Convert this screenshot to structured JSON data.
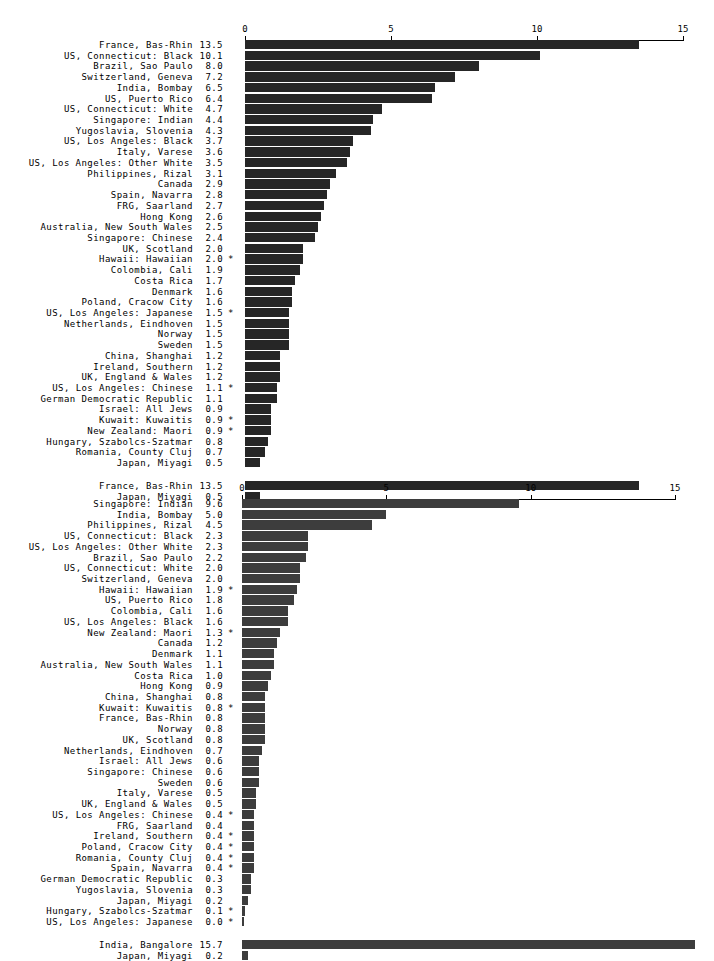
{
  "figure": {
    "background": "#ffffff",
    "bar_color_top": "#262626",
    "bar_color_bottom": "#3d3d3d"
  },
  "chart_data": [
    {
      "type": "bar",
      "orientation": "horizontal",
      "title": "",
      "xlabel": "",
      "ylabel": "",
      "xlim": [
        0,
        15
      ],
      "xticks": [
        0,
        5,
        10,
        15
      ],
      "xtick_labels": [
        "0",
        "5",
        "10",
        "15"
      ],
      "grid": false,
      "legend": "none",
      "bar_color": "#262626",
      "footnote_marker": "*",
      "categories": [
        "France, Bas-Rhin",
        "US, Connecticut: Black",
        "Brazil, Sao Paulo",
        "Switzerland, Geneva",
        "India, Bombay",
        "US, Puerto Rico",
        "US, Connecticut: White",
        "Singapore: Indian",
        "Yugoslavia, Slovenia",
        "US, Los Angeles: Black",
        "Italy, Varese",
        "US, Los Angeles: Other White",
        "Philippines, Rizal",
        "Canada",
        "Spain, Navarra",
        "FRG, Saarland",
        "Hong Kong",
        "Australia, New South Wales",
        "Singapore: Chinese",
        "UK, Scotland",
        "Hawaii: Hawaiian",
        "Colombia, Cali",
        "Costa Rica",
        "Denmark",
        "Poland, Cracow City",
        "US, Los Angeles: Japanese",
        "Netherlands, Eindhoven",
        "Norway",
        "Sweden",
        "China, Shanghai",
        "Ireland, Southern",
        "UK, England & Wales",
        "US, Los Angeles: Chinese",
        "German Democratic Republic",
        "Israel: All Jews",
        "Kuwait: Kuwaitis",
        "New Zealand: Maori",
        "Hungary, Szabolcs-Szatmar",
        "Romania, County Cluj",
        "Japan, Miyagi"
      ],
      "values": [
        13.5,
        10.1,
        8.0,
        7.2,
        6.5,
        6.4,
        4.7,
        4.4,
        4.3,
        3.7,
        3.6,
        3.5,
        3.1,
        2.9,
        2.8,
        2.7,
        2.6,
        2.5,
        2.4,
        2.0,
        2.0,
        1.9,
        1.7,
        1.6,
        1.6,
        1.5,
        1.5,
        1.5,
        1.5,
        1.2,
        1.2,
        1.2,
        1.1,
        1.1,
        0.9,
        0.9,
        0.9,
        0.8,
        0.7,
        0.5
      ],
      "value_labels": [
        "13.5",
        "10.1",
        "8.0",
        "7.2",
        "6.5",
        "6.4",
        "4.7",
        "4.4",
        "4.3",
        "3.7",
        "3.6",
        "3.5",
        "3.1",
        "2.9",
        "2.8",
        "2.7",
        "2.6",
        "2.5",
        "2.4",
        "2.0",
        "2.0",
        "1.9",
        "1.7",
        "1.6",
        "1.6",
        "1.5",
        "1.5",
        "1.5",
        "1.5",
        "1.2",
        "1.2",
        "1.2",
        "1.1",
        "1.1",
        "0.9",
        "0.9",
        "0.9",
        "0.8",
        "0.7",
        "0.5"
      ],
      "markers": [
        "",
        "",
        "",
        "",
        "",
        "",
        "",
        "",
        "",
        "",
        "",
        "",
        "",
        "",
        "",
        "",
        "",
        "",
        "",
        "",
        "*",
        "",
        "",
        "",
        "",
        "*",
        "",
        "",
        "",
        "",
        "",
        "",
        "*",
        "",
        "",
        "*",
        "*",
        "",
        "",
        ""
      ],
      "summary": {
        "categories": [
          "France, Bas-Rhin",
          "Japan, Miyagi"
        ],
        "values": [
          13.5,
          0.5
        ],
        "value_labels": [
          "13.5",
          "0.5"
        ],
        "markers": [
          "",
          ""
        ]
      }
    },
    {
      "type": "bar",
      "orientation": "horizontal",
      "title": "",
      "xlabel": "",
      "ylabel": "",
      "xlim": [
        0,
        15
      ],
      "xticks": [
        0,
        5,
        10,
        15
      ],
      "xtick_labels": [
        "0",
        "5",
        "10",
        "15"
      ],
      "grid": false,
      "legend": "none",
      "bar_color": "#3d3d3d",
      "footnote_marker": "*",
      "categories": [
        "Singapore: Indian",
        "India, Bombay",
        "Philippines, Rizal",
        "US, Connecticut: Black",
        "US, Los Angeles: Other White",
        "Brazil, Sao Paulo",
        "US, Connecticut: White",
        "Switzerland, Geneva",
        "Hawaii: Hawaiian",
        "US, Puerto Rico",
        "Colombia, Cali",
        "US, Los Angeles: Black",
        "New Zealand: Maori",
        "Canada",
        "Denmark",
        "Australia, New South Wales",
        "Costa Rica",
        "Hong Kong",
        "China, Shanghai",
        "Kuwait: Kuwaitis",
        "France, Bas-Rhin",
        "Norway",
        "UK, Scotland",
        "Netherlands, Eindhoven",
        "Israel: All Jews",
        "Singapore: Chinese",
        "Sweden",
        "Italy, Varese",
        "UK, England & Wales",
        "US, Los Angeles: Chinese",
        "FRG, Saarland",
        "Ireland, Southern",
        "Poland, Cracow City",
        "Romania, County Cluj",
        "Spain, Navarra",
        "German Democratic Republic",
        "Yugoslavia, Slovenia",
        "Japan, Miyagi",
        "Hungary, Szabolcs-Szatmar",
        "US, Los Angeles: Japanese"
      ],
      "values": [
        9.6,
        5.0,
        4.5,
        2.3,
        2.3,
        2.2,
        2.0,
        2.0,
        1.9,
        1.8,
        1.6,
        1.6,
        1.3,
        1.2,
        1.1,
        1.1,
        1.0,
        0.9,
        0.8,
        0.8,
        0.8,
        0.8,
        0.8,
        0.7,
        0.6,
        0.6,
        0.6,
        0.5,
        0.5,
        0.4,
        0.4,
        0.4,
        0.4,
        0.4,
        0.4,
        0.3,
        0.3,
        0.2,
        0.1,
        0.0
      ],
      "value_labels": [
        "9.6",
        "5.0",
        "4.5",
        "2.3",
        "2.3",
        "2.2",
        "2.0",
        "2.0",
        "1.9",
        "1.8",
        "1.6",
        "1.6",
        "1.3",
        "1.2",
        "1.1",
        "1.1",
        "1.0",
        "0.9",
        "0.8",
        "0.8",
        "0.8",
        "0.8",
        "0.8",
        "0.7",
        "0.6",
        "0.6",
        "0.6",
        "0.5",
        "0.5",
        "0.4",
        "0.4",
        "0.4",
        "0.4",
        "0.4",
        "0.4",
        "0.3",
        "0.3",
        "0.2",
        "0.1",
        "0.0"
      ],
      "markers": [
        "",
        "",
        "",
        "",
        "",
        "",
        "",
        "",
        "*",
        "",
        "",
        "",
        "*",
        "",
        "",
        "",
        "",
        "",
        "",
        "*",
        "",
        "",
        "",
        "",
        "",
        "",
        "",
        "",
        "",
        "*",
        "",
        "*",
        "*",
        "*",
        "*",
        "",
        "",
        "",
        "*",
        "*"
      ],
      "summary": {
        "categories": [
          "India, Bangalore",
          "Japan, Miyagi"
        ],
        "values": [
          15.7,
          0.2
        ],
        "value_labels": [
          "15.7",
          "0.2"
        ],
        "markers": [
          "",
          ""
        ]
      }
    }
  ]
}
